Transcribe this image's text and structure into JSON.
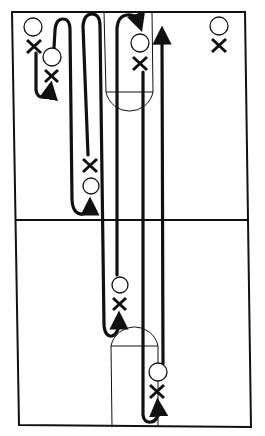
{
  "diagram": {
    "title": "",
    "type": "basketball full-court drill diagram",
    "colors": {
      "ink": "#111111",
      "background": "#ffffff"
    },
    "court": {
      "outline": "full court rectangle",
      "midcourt_line": true,
      "top_key": "free-throw lane with semicircle",
      "bottom_key": "free-throw lane with semicircle"
    },
    "legend": {
      "offense_symbol": "O",
      "defense_symbol": "X"
    },
    "players": [
      {
        "id": "o1",
        "symbol": "O",
        "x": 33,
        "y": 27
      },
      {
        "id": "x1",
        "symbol": "X",
        "x": 34,
        "y": 46
      },
      {
        "id": "o2",
        "symbol": "O",
        "x": 52,
        "y": 57
      },
      {
        "id": "x2",
        "symbol": "X",
        "x": 51,
        "y": 76
      },
      {
        "id": "o3",
        "symbol": "O",
        "x": 140,
        "y": 43
      },
      {
        "id": "x3",
        "symbol": "X",
        "x": 140,
        "y": 63
      },
      {
        "id": "o4",
        "symbol": "O",
        "x": 219,
        "y": 26
      },
      {
        "id": "x4",
        "symbol": "X",
        "x": 219,
        "y": 45
      },
      {
        "id": "x5",
        "symbol": "X",
        "x": 90,
        "y": 166
      },
      {
        "id": "o5",
        "symbol": "O",
        "x": 91,
        "y": 186
      },
      {
        "id": "o6",
        "symbol": "O",
        "x": 120,
        "y": 285
      },
      {
        "id": "x6",
        "symbol": "X",
        "x": 119,
        "y": 304
      },
      {
        "id": "o7",
        "symbol": "O",
        "x": 158,
        "y": 372
      },
      {
        "id": "x7",
        "symbol": "X",
        "x": 157,
        "y": 391
      }
    ],
    "movement_paths": [
      {
        "id": "path-1",
        "description": "short cut from top-left corner curling down then right"
      },
      {
        "id": "path-2",
        "description": "weave up to baseline and back down to mid-left"
      },
      {
        "id": "path-3",
        "description": "long run from top baseline to lower key, curling up"
      },
      {
        "id": "path-4",
        "description": "long run down to bottom baseline, curling up to bottom block"
      },
      {
        "id": "path-5",
        "description": "baseline-to-baseline sprint ending with arrow at top"
      },
      {
        "id": "path-6",
        "description": "curl over top of lane ending at top block"
      }
    ]
  }
}
